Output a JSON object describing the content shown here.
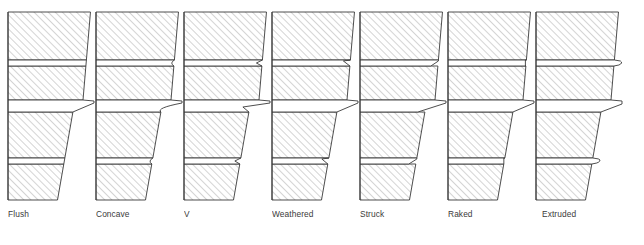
{
  "figure": {
    "width": 644,
    "height": 245,
    "background_color": "#ffffff",
    "outline_color": "#3a3a3a",
    "hatch_color": "#9a9a9a",
    "label_color": "#3b3b3b",
    "hatch_angle_degrees": 45,
    "column_count": 7,
    "column_spacing": 88,
    "column_left_start": 15,
    "block_width": 75,
    "courses_per_column": 4,
    "joints_per_column": 3,
    "label_baseline_y": 215
  },
  "joints": [
    {
      "id": "flush",
      "label": "Flush",
      "x": 0,
      "label_x": 8,
      "description": "mortar finished level with the brick face",
      "profile": "flush"
    },
    {
      "id": "concave",
      "label": "Concave",
      "x": 88,
      "label_x": 8,
      "description": "mortar tooled to a shallow curved recess",
      "profile": "concave"
    },
    {
      "id": "v",
      "label": "V",
      "x": 176,
      "label_x": 8,
      "description": "mortar tooled to a V shaped notch",
      "profile": "v"
    },
    {
      "id": "weathered",
      "label": "Weathered",
      "x": 264,
      "label_x": 8,
      "description": "mortar sloped back at the top edge, shedding water",
      "profile": "weathered"
    },
    {
      "id": "struck",
      "label": "Struck",
      "x": 352,
      "label_x": 8,
      "description": "mortar sloped back at the bottom edge",
      "profile": "struck"
    },
    {
      "id": "raked",
      "label": "Raked",
      "x": 440,
      "label_x": 8,
      "description": "mortar raked out to a deep square recess",
      "profile": "raked"
    },
    {
      "id": "extruded",
      "label": "Extruded",
      "x": 528,
      "label_x": 14,
      "description": "mortar squeezed out beyond the brick face",
      "profile": "extruded"
    }
  ]
}
